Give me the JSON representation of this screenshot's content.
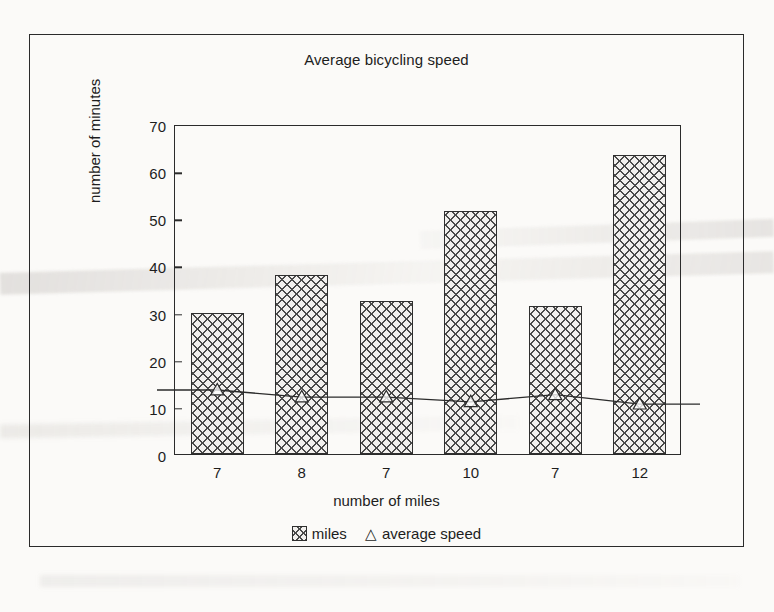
{
  "chart_data": {
    "type": "bar",
    "title": "Average bicycling speed",
    "xlabel": "number of miles",
    "ylabel": "number of minutes",
    "categories": [
      "7",
      "8",
      "7",
      "10",
      "7",
      "12"
    ],
    "ylim": [
      0,
      70
    ],
    "ytick_step": 10,
    "yticks": [
      "0",
      "10",
      "20",
      "30",
      "40",
      "50",
      "60",
      "70"
    ],
    "grid": false,
    "legend_position": "bottom",
    "series": [
      {
        "name": "miles",
        "kind": "bar",
        "marker": "crosshatch-swatch",
        "values": [
          30,
          38,
          32.5,
          51.5,
          31.5,
          63.5
        ]
      },
      {
        "name": "average speed",
        "kind": "line",
        "marker": "triangle",
        "values": [
          14,
          12.5,
          12.5,
          11.5,
          13,
          11
        ]
      }
    ],
    "colors": {
      "ink": "#2b2b2b",
      "bar_fill": "#f2f0ee",
      "bar_hatch": "#4a4a4a",
      "page_background": "#fbfaf8"
    }
  },
  "legend": {
    "items": [
      {
        "label": "miles",
        "icon": "crosshatch-swatch-icon"
      },
      {
        "label": "average speed",
        "icon": "triangle-marker-icon",
        "glyph": "△"
      }
    ]
  }
}
